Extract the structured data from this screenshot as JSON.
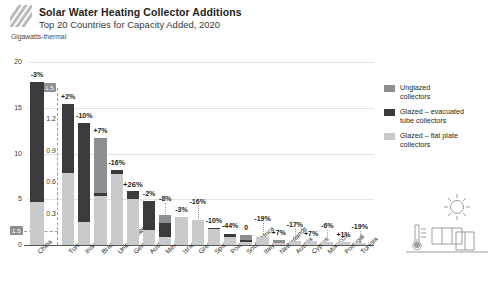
{
  "header": {
    "logo_name": "hatch-logo-mark",
    "title": "Solar Water Heating Collector Additions",
    "subtitle": "Top 20 Countries for Capacity Added, 2020"
  },
  "axis": {
    "unit_label": "Gigawatts-thermal",
    "main_ticks": [
      "0",
      "5",
      "10",
      "15",
      "20"
    ],
    "main_max": 20,
    "inset_ticks": [
      "0.3",
      "0.6",
      "0.9",
      "1.2"
    ],
    "inset_tag": "1.5",
    "base_tag": "1.5",
    "inset_max": 1.5
  },
  "legend": {
    "items": [
      {
        "label": "Unglazed\ncollectors",
        "line1": "Unglazed",
        "line2": "collectors",
        "color": "#8d9093"
      },
      {
        "label": "Glazed – evacuated tube collectors",
        "line1": "Glazed – evacuated",
        "line2": "tube collectors",
        "color": "#3b3b3d"
      },
      {
        "label": "Glazed – flat plate collectors",
        "line1": "Glazed – flat plate",
        "line2": "collectors",
        "color": "#c8cacb"
      }
    ]
  },
  "decor": {
    "name": "solar-thermal-collector-illustration",
    "parts": [
      "sun-icon",
      "collector-panel-icon",
      "thermometer-icon"
    ]
  },
  "chart_data": {
    "type": "bar",
    "stacked": true,
    "title": "Solar Water Heating Collector Additions",
    "subtitle": "Top 20 Countries for Capacity Added, 2020",
    "ylabel": "Gigawatts-thermal",
    "xlabel": "",
    "grid": true,
    "legend_position": "right",
    "main_ylim": [
      0,
      20
    ],
    "inset_ylim": [
      0,
      1.5
    ],
    "series_names": [
      "Glazed – flat plate collectors",
      "Glazed – evacuated tube collectors",
      "Unglazed collectors"
    ],
    "series_colors": [
      "#c8cacb",
      "#3b3b3d",
      "#8d9093"
    ],
    "categories": [
      "China",
      "Turkey",
      "India",
      "Brazil",
      "United States",
      "Germany",
      "Australia",
      "Mexico",
      "Israel",
      "Greece",
      "Spain",
      "Poland",
      "South Africa",
      "Italy",
      "Netherlands",
      "Austria",
      "Cyprus",
      "Morocco",
      "Portugal",
      "Tunisia"
    ],
    "change_labels": [
      "-3%",
      "+2%",
      "-10%",
      "+7%",
      "-16%",
      "+26%",
      "-2%",
      "-8%",
      "-3%",
      "-16%",
      "-10%",
      "-44%",
      "0",
      "-19%",
      "+7%",
      "-17%",
      "+7%",
      "-6%",
      "+1%",
      "-19%"
    ],
    "bars": [
      {
        "name": "China",
        "scale": "main",
        "total": 17.8,
        "flat_plate": 4.7,
        "evacuated": 13.1,
        "unglazed": 0.0,
        "change": "-3%"
      },
      {
        "name": "Turkey",
        "scale": "inset",
        "total": 1.35,
        "flat_plate": 0.69,
        "evacuated": 0.66,
        "unglazed": 0.0,
        "change": "+2%"
      },
      {
        "name": "India",
        "scale": "inset",
        "total": 1.17,
        "flat_plate": 0.22,
        "evacuated": 0.95,
        "unglazed": 0.0,
        "change": "-10%"
      },
      {
        "name": "Brazil",
        "scale": "inset",
        "total": 1.02,
        "flat_plate": 0.47,
        "evacuated": 0.03,
        "unglazed": 0.52,
        "change": "+7%"
      },
      {
        "name": "United States",
        "scale": "inset",
        "total": 0.72,
        "flat_plate": 0.68,
        "evacuated": 0.04,
        "unglazed": 0.0,
        "change": "-16%"
      },
      {
        "name": "Germany",
        "scale": "inset",
        "total": 0.52,
        "flat_plate": 0.44,
        "evacuated": 0.08,
        "unglazed": 0.0,
        "change": "+26%"
      },
      {
        "name": "Australia",
        "scale": "inset",
        "total": 0.42,
        "flat_plate": 0.14,
        "evacuated": 0.28,
        "unglazed": 0.0,
        "change": "-2%"
      },
      {
        "name": "Mexico",
        "scale": "inset",
        "total": 0.29,
        "flat_plate": 0.08,
        "evacuated": 0.13,
        "unglazed": 0.08,
        "change": "-8%"
      },
      {
        "name": "Israel",
        "scale": "inset",
        "total": 0.27,
        "flat_plate": 0.27,
        "evacuated": 0.0,
        "unglazed": 0.0,
        "change": "-3%"
      },
      {
        "name": "Greece",
        "scale": "inset",
        "total": 0.24,
        "flat_plate": 0.24,
        "evacuated": 0.0,
        "unglazed": 0.0,
        "change": "-16%"
      },
      {
        "name": "Spain",
        "scale": "inset",
        "total": 0.16,
        "flat_plate": 0.15,
        "evacuated": 0.01,
        "unglazed": 0.0,
        "change": "-10%"
      },
      {
        "name": "Poland",
        "scale": "inset",
        "total": 0.11,
        "flat_plate": 0.08,
        "evacuated": 0.03,
        "unglazed": 0.0,
        "change": "-44%"
      },
      {
        "name": "South Africa",
        "scale": "inset",
        "total": 0.1,
        "flat_plate": 0.03,
        "evacuated": 0.02,
        "unglazed": 0.05,
        "change": "0"
      },
      {
        "name": "Italy",
        "scale": "inset",
        "total": 0.08,
        "flat_plate": 0.08,
        "evacuated": 0.0,
        "unglazed": 0.0,
        "change": "-19%"
      },
      {
        "name": "Netherlands",
        "scale": "inset",
        "total": 0.05,
        "flat_plate": 0.02,
        "evacuated": 0.0,
        "unglazed": 0.03,
        "change": "+7%"
      },
      {
        "name": "Austria",
        "scale": "inset",
        "total": 0.04,
        "flat_plate": 0.04,
        "evacuated": 0.0,
        "unglazed": 0.0,
        "change": "-17%"
      },
      {
        "name": "Cyprus",
        "scale": "inset",
        "total": 0.04,
        "flat_plate": 0.04,
        "evacuated": 0.0,
        "unglazed": 0.0,
        "change": "+7%"
      },
      {
        "name": "Morocco",
        "scale": "inset",
        "total": 0.03,
        "flat_plate": 0.03,
        "evacuated": 0.0,
        "unglazed": 0.0,
        "change": "-6%"
      },
      {
        "name": "Portugal",
        "scale": "inset",
        "total": 0.03,
        "flat_plate": 0.03,
        "evacuated": 0.0,
        "unglazed": 0.0,
        "change": "+1%"
      },
      {
        "name": "Tunisia",
        "scale": "inset",
        "total": 0.02,
        "flat_plate": 0.02,
        "evacuated": 0.0,
        "unglazed": 0.0,
        "change": "-19%"
      }
    ]
  }
}
